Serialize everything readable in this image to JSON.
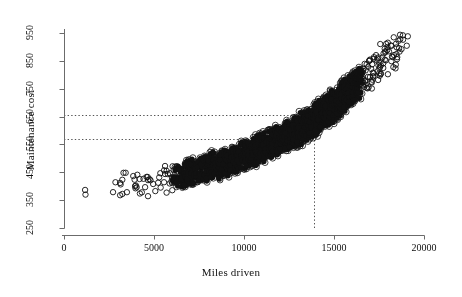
{
  "chart_data": {
    "type": "scatter",
    "title": "",
    "xlabel": "Miles driven",
    "ylabel": "Maintenance cost",
    "xlim": [
      0,
      20000
    ],
    "ylim": [
      250,
      950
    ],
    "xticks": [
      0,
      5000,
      10000,
      15000,
      20000
    ],
    "xtick_labels": [
      "0",
      "5000",
      "10000",
      "15000",
      "20000"
    ],
    "yticks": [
      250,
      350,
      450,
      550,
      650,
      750,
      850,
      950
    ],
    "ytick_labels": [
      "250",
      "350",
      "450",
      "550",
      "650",
      "750",
      "850",
      "950"
    ],
    "grid": false,
    "legend": "none",
    "marker_style": "open-circle",
    "marker_color": "#111111",
    "marker_size_px": 3,
    "reference_lines": [
      {
        "orientation": "horizontal",
        "value": 655,
        "style": "dotted",
        "color": "#555555",
        "x_start": 0,
        "x_end": 13900
      },
      {
        "orientation": "horizontal",
        "value": 568,
        "style": "dotted",
        "color": "#555555",
        "x_start": 0,
        "x_end": 13900
      },
      {
        "orientation": "vertical",
        "value": 13900,
        "style": "dotted",
        "color": "#555555",
        "y_start": 250,
        "y_end": 655
      }
    ],
    "points": [
      [
        1450,
        365
      ],
      [
        2750,
        400
      ],
      [
        2980,
        372
      ],
      [
        3180,
        418
      ],
      [
        3350,
        392
      ],
      [
        3520,
        430
      ],
      [
        3700,
        379
      ],
      [
        3880,
        408
      ],
      [
        4020,
        441
      ],
      [
        4160,
        396
      ],
      [
        4310,
        423
      ],
      [
        4460,
        380
      ],
      [
        4600,
        446
      ],
      [
        4740,
        404
      ],
      [
        4880,
        430
      ],
      [
        5020,
        388
      ],
      [
        5160,
        452
      ],
      [
        5300,
        412
      ],
      [
        5440,
        437
      ],
      [
        5560,
        396
      ],
      [
        5690,
        462
      ],
      [
        5810,
        420
      ],
      [
        5930,
        445
      ],
      [
        6040,
        402
      ],
      [
        6160,
        468
      ],
      [
        6270,
        428
      ],
      [
        6380,
        452
      ],
      [
        6480,
        410
      ],
      [
        6580,
        473
      ],
      [
        6680,
        436
      ],
      [
        6780,
        458
      ],
      [
        6870,
        417
      ],
      [
        6960,
        478
      ],
      [
        7050,
        442
      ],
      [
        7140,
        463
      ],
      [
        7230,
        424
      ],
      [
        7320,
        484
      ],
      [
        7400,
        447
      ],
      [
        7480,
        468
      ],
      [
        7560,
        430
      ],
      [
        7640,
        489
      ],
      [
        7720,
        452
      ],
      [
        7800,
        473
      ],
      [
        7870,
        436
      ],
      [
        7940,
        494
      ],
      [
        8010,
        457
      ],
      [
        8080,
        478
      ],
      [
        8150,
        441
      ],
      [
        8220,
        499
      ],
      [
        8290,
        462
      ],
      [
        8360,
        483
      ],
      [
        8420,
        446
      ],
      [
        8490,
        505
      ],
      [
        8550,
        468
      ],
      [
        8620,
        488
      ],
      [
        8680,
        451
      ],
      [
        8740,
        510
      ],
      [
        8800,
        473
      ],
      [
        8870,
        494
      ],
      [
        8930,
        457
      ],
      [
        8990,
        516
      ],
      [
        9050,
        478
      ],
      [
        9110,
        499
      ],
      [
        9170,
        462
      ],
      [
        9230,
        521
      ],
      [
        9290,
        484
      ],
      [
        9340,
        505
      ],
      [
        9400,
        468
      ],
      [
        9460,
        527
      ],
      [
        9520,
        489
      ],
      [
        9570,
        511
      ],
      [
        9630,
        473
      ],
      [
        9690,
        532
      ],
      [
        9740,
        494
      ],
      [
        9800,
        516
      ],
      [
        9850,
        478
      ],
      [
        9910,
        538
      ],
      [
        9960,
        500
      ],
      [
        10020,
        522
      ],
      [
        10070,
        484
      ],
      [
        10130,
        543
      ],
      [
        10180,
        505
      ],
      [
        10230,
        527
      ],
      [
        10290,
        489
      ],
      [
        10340,
        549
      ],
      [
        10390,
        511
      ],
      [
        10440,
        533
      ],
      [
        10500,
        494
      ],
      [
        10550,
        554
      ],
      [
        10600,
        516
      ],
      [
        10650,
        538
      ],
      [
        10700,
        500
      ],
      [
        10760,
        560
      ],
      [
        10810,
        522
      ],
      [
        10860,
        544
      ],
      [
        10910,
        505
      ],
      [
        10960,
        566
      ],
      [
        11010,
        527
      ],
      [
        11060,
        549
      ],
      [
        11110,
        511
      ],
      [
        11160,
        571
      ],
      [
        11210,
        533
      ],
      [
        11260,
        555
      ],
      [
        11310,
        516
      ],
      [
        11360,
        577
      ],
      [
        11410,
        539
      ],
      [
        11450,
        561
      ],
      [
        11500,
        522
      ],
      [
        11550,
        583
      ],
      [
        11600,
        544
      ],
      [
        11650,
        567
      ],
      [
        11700,
        528
      ],
      [
        11740,
        589
      ],
      [
        11790,
        550
      ],
      [
        11840,
        572
      ],
      [
        11890,
        534
      ],
      [
        11930,
        595
      ],
      [
        11980,
        556
      ],
      [
        12030,
        578
      ],
      [
        12070,
        539
      ],
      [
        12120,
        601
      ],
      [
        12170,
        562
      ],
      [
        12210,
        584
      ],
      [
        12260,
        545
      ],
      [
        12300,
        607
      ],
      [
        12350,
        568
      ],
      [
        12390,
        591
      ],
      [
        12440,
        551
      ],
      [
        12480,
        613
      ],
      [
        12530,
        574
      ],
      [
        12570,
        597
      ],
      [
        12620,
        557
      ],
      [
        12660,
        620
      ],
      [
        12700,
        580
      ],
      [
        12750,
        603
      ],
      [
        12790,
        563
      ],
      [
        12830,
        626
      ],
      [
        12880,
        587
      ],
      [
        12920,
        610
      ],
      [
        12960,
        569
      ],
      [
        13000,
        633
      ],
      [
        13050,
        593
      ],
      [
        13090,
        617
      ],
      [
        13130,
        576
      ],
      [
        13170,
        640
      ],
      [
        13210,
        600
      ],
      [
        13250,
        623
      ],
      [
        13290,
        582
      ],
      [
        13340,
        647
      ],
      [
        13380,
        606
      ],
      [
        13420,
        630
      ],
      [
        13460,
        589
      ],
      [
        13500,
        654
      ],
      [
        13540,
        613
      ],
      [
        13580,
        637
      ],
      [
        13620,
        596
      ],
      [
        13660,
        661
      ],
      [
        13700,
        620
      ],
      [
        13740,
        644
      ],
      [
        13780,
        603
      ],
      [
        13820,
        668
      ],
      [
        13860,
        627
      ],
      [
        13900,
        651
      ],
      [
        13940,
        610
      ],
      [
        13980,
        675
      ],
      [
        14020,
        634
      ],
      [
        14060,
        659
      ],
      [
        14100,
        617
      ],
      [
        14140,
        683
      ],
      [
        14180,
        641
      ],
      [
        14220,
        666
      ],
      [
        14260,
        624
      ],
      [
        14300,
        690
      ],
      [
        14340,
        649
      ],
      [
        14380,
        674
      ],
      [
        14420,
        632
      ],
      [
        14460,
        698
      ],
      [
        14500,
        656
      ],
      [
        14540,
        682
      ],
      [
        14580,
        639
      ],
      [
        14620,
        706
      ],
      [
        14660,
        664
      ],
      [
        14700,
        690
      ],
      [
        14740,
        647
      ],
      [
        14780,
        714
      ],
      [
        14820,
        672
      ],
      [
        14860,
        698
      ],
      [
        14900,
        655
      ],
      [
        14940,
        722
      ],
      [
        14980,
        680
      ],
      [
        15020,
        707
      ],
      [
        15060,
        663
      ],
      [
        15100,
        731
      ],
      [
        15140,
        688
      ],
      [
        15180,
        715
      ],
      [
        15220,
        671
      ],
      [
        15260,
        739
      ],
      [
        15300,
        697
      ],
      [
        15340,
        724
      ],
      [
        15380,
        680
      ],
      [
        15420,
        748
      ],
      [
        15460,
        705
      ],
      [
        15500,
        733
      ],
      [
        15540,
        689
      ],
      [
        15580,
        757
      ],
      [
        15620,
        714
      ],
      [
        15660,
        742
      ],
      [
        15700,
        698
      ],
      [
        15740,
        766
      ],
      [
        15780,
        723
      ],
      [
        15820,
        751
      ],
      [
        15860,
        707
      ],
      [
        15900,
        775
      ],
      [
        15940,
        732
      ],
      [
        15980,
        760
      ],
      [
        16020,
        716
      ],
      [
        16060,
        785
      ],
      [
        16100,
        741
      ],
      [
        16140,
        770
      ],
      [
        16180,
        726
      ],
      [
        16220,
        794
      ],
      [
        16260,
        750
      ],
      [
        16300,
        779
      ],
      [
        16340,
        735
      ],
      [
        16380,
        804
      ],
      [
        16420,
        760
      ],
      [
        16460,
        789
      ],
      [
        16500,
        745
      ],
      [
        16540,
        814
      ],
      [
        16580,
        770
      ],
      [
        16620,
        799
      ],
      [
        16660,
        755
      ],
      [
        16700,
        824
      ],
      [
        16740,
        780
      ],
      [
        16790,
        810
      ],
      [
        16830,
        765
      ],
      [
        16870,
        835
      ],
      [
        16920,
        790
      ],
      [
        16960,
        820
      ],
      [
        17000,
        776
      ],
      [
        17050,
        845
      ],
      [
        17100,
        801
      ],
      [
        17140,
        831
      ],
      [
        17190,
        786
      ],
      [
        17230,
        856
      ],
      [
        17280,
        812
      ],
      [
        17330,
        842
      ],
      [
        17380,
        797
      ],
      [
        17420,
        867
      ],
      [
        17470,
        823
      ],
      [
        17520,
        853
      ],
      [
        17570,
        808
      ],
      [
        17620,
        878
      ],
      [
        17670,
        834
      ],
      [
        17720,
        864
      ],
      [
        17780,
        819
      ],
      [
        17830,
        890
      ],
      [
        17880,
        846
      ],
      [
        17940,
        876
      ],
      [
        17990,
        831
      ],
      [
        18050,
        901
      ],
      [
        18110,
        857
      ],
      [
        18170,
        888
      ],
      [
        18230,
        843
      ],
      [
        18290,
        913
      ],
      [
        18350,
        869
      ],
      [
        18420,
        900
      ],
      [
        18480,
        855
      ],
      [
        18550,
        925
      ],
      [
        18620,
        881
      ],
      [
        18700,
        912
      ],
      [
        18780,
        938
      ],
      [
        18820,
        896
      ],
      [
        18900,
        944
      ]
    ]
  }
}
